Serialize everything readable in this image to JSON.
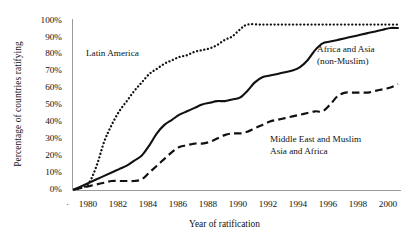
{
  "chart_data": {
    "type": "line",
    "title": "",
    "xlabel": "Year of ratification",
    "ylabel": "Percentage of countries ratifying",
    "xlim": [
      1979.4,
      2001.2
    ],
    "ylim": [
      0,
      100
    ],
    "grid": false,
    "legend_position": "inline-annotations",
    "y_ticks": [
      "0%",
      "10%",
      "20%",
      "30%",
      "40%",
      "50%",
      "60%",
      "70%",
      "80%",
      "90%",
      "100%"
    ],
    "y_tick_values": [
      0,
      10,
      20,
      30,
      40,
      50,
      60,
      70,
      80,
      90,
      100
    ],
    "x_ticks": [
      "1980",
      "1982",
      "1984",
      "1986",
      "1988",
      "1990",
      "1992",
      "1994",
      "1996",
      "1998",
      "2000"
    ],
    "x_tick_values": [
      1980,
      1982,
      1984,
      1986,
      1988,
      1990,
      1992,
      1994,
      1996,
      1998,
      2000
    ],
    "x_axis_leading_marker": "·",
    "series": [
      {
        "name": "Latin America",
        "style": "dotted",
        "color": "#111111",
        "x": [
          1979.5,
          1980,
          1980.5,
          1981,
          1981.5,
          1982,
          1982.5,
          1983,
          1983.5,
          1984,
          1984.5,
          1985,
          1985.5,
          1986,
          1986.5,
          1987,
          1987.5,
          1988,
          1988.5,
          1989,
          1989.5,
          1990,
          1990.5,
          1991,
          1992,
          1993,
          1994,
          1995,
          1996,
          1997,
          1998,
          1999,
          2000,
          2001
        ],
        "y": [
          0,
          1,
          4,
          14,
          28,
          38,
          46,
          52,
          58,
          63,
          68,
          71,
          74,
          76,
          78,
          79,
          81,
          82,
          83,
          85,
          88,
          90,
          94,
          97,
          97,
          97,
          97,
          97,
          97,
          97,
          97,
          97,
          97,
          97
        ]
      },
      {
        "name": "Africa and Asia (non-Muslim)",
        "style": "solid",
        "color": "#111111",
        "x": [
          1979.5,
          1980,
          1980.5,
          1981,
          1981.5,
          1982,
          1982.5,
          1983,
          1983.5,
          1984,
          1984.5,
          1985,
          1985.5,
          1986,
          1986.5,
          1987,
          1987.5,
          1988,
          1988.5,
          1989,
          1989.5,
          1990,
          1990.5,
          1991,
          1991.5,
          1992,
          1992.5,
          1993,
          1993.5,
          1994,
          1994.5,
          1995,
          1995.5,
          1996,
          1996.5,
          1997,
          1997.5,
          1998,
          1998.5,
          1999,
          1999.5,
          2000,
          2000.5,
          2001
        ],
        "y": [
          0,
          2,
          4,
          6,
          8,
          10,
          12,
          14,
          17,
          20,
          26,
          33,
          38,
          41,
          44,
          46,
          48,
          50,
          51,
          52,
          52,
          53,
          54,
          58,
          63,
          66,
          67,
          68,
          69,
          70,
          72,
          76,
          82,
          86,
          87,
          88,
          89,
          90,
          91,
          92,
          93,
          94,
          95,
          95
        ]
      },
      {
        "name": "Middle East and Muslim Asia and Africa",
        "style": "dashed",
        "color": "#111111",
        "x": [
          1979.5,
          1980,
          1980.5,
          1981,
          1981.5,
          1982,
          1982.5,
          1983,
          1983.5,
          1984,
          1984.5,
          1985,
          1985.5,
          1986,
          1986.5,
          1987,
          1987.5,
          1988,
          1988.5,
          1989,
          1989.5,
          1990,
          1990.5,
          1991,
          1991.5,
          1992,
          1992.5,
          1993,
          1993.5,
          1994,
          1994.5,
          1995,
          1995.5,
          1996,
          1996.5,
          1997,
          1997.5,
          1998,
          1998.5,
          1999,
          1999.5,
          2000,
          2000.5,
          2001
        ],
        "y": [
          0,
          1,
          2,
          3,
          4,
          5,
          5,
          5,
          5,
          6,
          10,
          14,
          18,
          22,
          25,
          26,
          27,
          27,
          28,
          30,
          32,
          33,
          33,
          34,
          36,
          38,
          40,
          41,
          42,
          43,
          44,
          45,
          46,
          46,
          50,
          55,
          57,
          57,
          57,
          57,
          58,
          59,
          60,
          62
        ]
      }
    ],
    "annotations": [
      {
        "id": "latin",
        "text": "Latin America",
        "x": 1981.0,
        "y": 83
      },
      {
        "id": "africa_line1",
        "text": "Africa and Asia",
        "x": 1995.0,
        "y": 86
      },
      {
        "id": "africa_line2",
        "text": "(non-Muslim)",
        "x": 1995.0,
        "y": 79
      },
      {
        "id": "middle_line1",
        "text": "Middle East and Muslim",
        "x": 1992.0,
        "y": 32
      },
      {
        "id": "middle_line2",
        "text": "Asia and Africa",
        "x": 1992.0,
        "y": 25
      }
    ]
  },
  "labels": {
    "y_axis_title": "Percentage of countries ratifying",
    "x_axis_title": "Year of ratification",
    "series_latin": "Latin America",
    "series_africa_l1": "Africa and Asia",
    "series_africa_l2": "(non-Muslim)",
    "series_middle_l1": "Middle East and Muslim",
    "series_middle_l2": "Asia and Africa",
    "x_leading_dot": "·"
  },
  "y_ticks": [
    "100%",
    "90%",
    "80%",
    "70%",
    "60%",
    "50%",
    "40%",
    "30%",
    "20%",
    "10%",
    "0%"
  ],
  "x_ticks": [
    "1980",
    "1982",
    "1984",
    "1986",
    "1988",
    "1990",
    "1992",
    "1994",
    "1996",
    "1998",
    "2000"
  ],
  "colors": {
    "ink": "#111111",
    "axis": "#9a9a9a",
    "background": "#ffffff"
  }
}
